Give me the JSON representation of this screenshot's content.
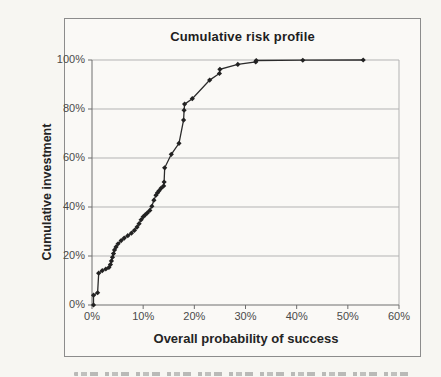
{
  "chart_data": {
    "type": "line",
    "title": "Cumulative risk profile",
    "xlabel": "Overall probability of success",
    "ylabel": "Cumulative investment",
    "x_tick_labels": [
      "0%",
      "10%",
      "20%",
      "30%",
      "40%",
      "50%",
      "60%"
    ],
    "x_tick_values": [
      0,
      10,
      20,
      30,
      40,
      50,
      60
    ],
    "y_tick_labels": [
      "0%",
      "20%",
      "40%",
      "60%",
      "80%",
      "100%"
    ],
    "y_tick_values": [
      0,
      20,
      40,
      60,
      80,
      100
    ],
    "xlim": [
      0,
      60
    ],
    "ylim": [
      0,
      100
    ],
    "grid": "horizontal-only",
    "legend_position": "none",
    "marker": "filled-diamond",
    "points": [
      [
        0.3,
        0
      ],
      [
        0.3,
        4
      ],
      [
        1.1,
        5
      ],
      [
        1.3,
        13
      ],
      [
        2.0,
        14
      ],
      [
        2.7,
        14.7
      ],
      [
        3.3,
        15.3
      ],
      [
        3.6,
        16.5
      ],
      [
        3.8,
        18
      ],
      [
        4.0,
        19.5
      ],
      [
        4.2,
        21
      ],
      [
        4.4,
        22.5
      ],
      [
        4.7,
        23.7
      ],
      [
        5.1,
        25
      ],
      [
        5.7,
        26.3
      ],
      [
        6.3,
        27.3
      ],
      [
        7.0,
        28.3
      ],
      [
        7.7,
        29.3
      ],
      [
        8.3,
        30.5
      ],
      [
        8.8,
        31.8
      ],
      [
        9.2,
        33.2
      ],
      [
        9.6,
        34.8
      ],
      [
        10.0,
        36
      ],
      [
        10.4,
        36.8
      ],
      [
        10.8,
        37.6
      ],
      [
        11.3,
        38.6
      ],
      [
        11.7,
        40.3
      ],
      [
        12.1,
        42.8
      ],
      [
        12.5,
        44.8
      ],
      [
        12.8,
        45.8
      ],
      [
        13.1,
        46.6
      ],
      [
        13.5,
        47.7
      ],
      [
        14.0,
        48.6
      ],
      [
        14.1,
        50.2
      ],
      [
        14.2,
        56
      ],
      [
        15.5,
        61.5
      ],
      [
        17.0,
        66
      ],
      [
        17.9,
        75.5
      ],
      [
        18.0,
        79.5
      ],
      [
        18.1,
        82
      ],
      [
        19.6,
        84.2
      ],
      [
        23.0,
        91.8
      ],
      [
        24.9,
        94.5
      ],
      [
        25.0,
        96.2
      ],
      [
        28.5,
        98.2
      ],
      [
        32.0,
        99.2
      ],
      [
        32.1,
        99.8
      ],
      [
        41.2,
        99.9
      ],
      [
        53.0,
        100
      ]
    ],
    "colors": {
      "line": "#2b2b2b",
      "marker": "#222222",
      "grid": "#b3b3b3",
      "axis": "#6e6e6e",
      "tick_text": "#4a4a4a",
      "title_text": "#1e1e1e",
      "frame_border": "#8c8c8c",
      "paper": "#f7f6f2"
    }
  }
}
